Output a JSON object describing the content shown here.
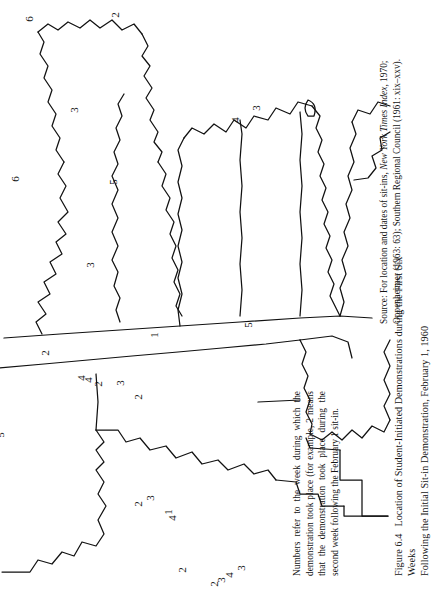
{
  "figure": {
    "number": "Figure 6.4",
    "title_line1": "Location of Student-Initiated Demonstrations during the First Six Weeks",
    "title_line2": "Following the Initial Sit-in Demonstration, February 1, 1960"
  },
  "note": {
    "text": "Numbers refer to the week during which the demonstration took place (for example, 2 means that the demonstration took place during the second week following the February 1 sit-in."
  },
  "source": {
    "prefix": "Source: For location and dates of sit-ins, ",
    "italic": "New York Times Index",
    "suffix": ", 1970; Oppenheimer (1963: 63); Southern Regional Council (1961: xix–xxv)."
  },
  "map": {
    "type": "choropleth-point-map",
    "region": "Southern and border United States",
    "legend_meaning": "Each printed digit marks a city where a student sit-in demonstration occurred; the digit is the week number (1-6) after February 1, 1960.",
    "line_color": "#111111",
    "fill_color": "#ffffff",
    "week_labels": [
      {
        "value": "3",
        "x": 163,
        "y": 22,
        "area": "Oklahoma/Kansas border"
      },
      {
        "value": "4",
        "x": 176,
        "y": 15,
        "area": "Oklahoma"
      },
      {
        "value": "3",
        "x": 185,
        "y": 10,
        "area": "Oklahoma"
      },
      {
        "value": "2",
        "x": 193,
        "y": 6,
        "area": "Oklahoma"
      },
      {
        "value": "2",
        "x": 228,
        "y": 20,
        "area": "Missouri"
      },
      {
        "value": "1",
        "x": 244,
        "y": 78,
        "area": "Tennessee"
      },
      {
        "value": "4",
        "x": 239,
        "y": 72,
        "area": "Tennessee"
      },
      {
        "value": "3",
        "x": 264,
        "y": 92,
        "area": "Tennessee"
      },
      {
        "value": "2",
        "x": 277,
        "y": 86,
        "area": "Tennessee"
      },
      {
        "value": "1",
        "x": 259,
        "y": 255,
        "area": "Tennessee west"
      },
      {
        "value": "2",
        "x": 277,
        "y": 193,
        "area": "Kentucky"
      },
      {
        "value": "3",
        "x": 297,
        "y": 207,
        "area": "Kentucky"
      },
      {
        "value": "2",
        "x": 321,
        "y": 206,
        "area": "Kentucky"
      },
      {
        "value": "4",
        "x": 332,
        "y": 210,
        "area": "Kentucky"
      },
      {
        "value": "4",
        "x": 340,
        "y": 212,
        "area": "Kentucky"
      },
      {
        "value": "5",
        "x": 155,
        "y": 265,
        "area": "Arkansas/Texas"
      },
      {
        "value": "5",
        "x": 430,
        "y": 155,
        "area": "Virginia"
      },
      {
        "value": "5",
        "x": 472,
        "y": 181,
        "area": "Virginia"
      },
      {
        "value": "5",
        "x": 486,
        "y": 188,
        "area": "Virginia"
      },
      {
        "value": "4",
        "x": 500,
        "y": 205,
        "area": "Virginia"
      },
      {
        "value": "4",
        "x": 510,
        "y": 212,
        "area": "Virginia"
      },
      {
        "value": "4",
        "x": 520,
        "y": 216,
        "area": "Virginia"
      },
      {
        "value": "2",
        "x": 380,
        "y": 237,
        "area": "North Carolina"
      },
      {
        "value": "6",
        "x": 742,
        "y": 238,
        "area": "Maryland"
      },
      {
        "value": "3",
        "x": 330,
        "y": 325,
        "area": "Arkansas"
      },
      {
        "value": "5",
        "x": 305,
        "y": 408,
        "area": "Arkansas"
      },
      {
        "value": "5",
        "x": 450,
        "y": 405,
        "area": "Mississippi/Alabama"
      },
      {
        "value": "3",
        "x": 348,
        "y": 480,
        "area": "Louisiana"
      },
      {
        "value": "2",
        "x": 302,
        "y": 575,
        "area": "Louisiana"
      },
      {
        "value": "6",
        "x": 397,
        "y": 571,
        "area": "Mississippi"
      },
      {
        "value": "3",
        "x": 146,
        "y": 482,
        "area": "Texas"
      },
      {
        "value": "4",
        "x": 170,
        "y": 470,
        "area": "Texas"
      },
      {
        "value": "44",
        "x": 570,
        "y": 520,
        "area": "Georgia"
      },
      {
        "value": "6",
        "x": 413,
        "y": 411,
        "area": "Florida panhandle"
      },
      {
        "value": "5",
        "x": 520,
        "y": 600,
        "area": "Florida"
      },
      {
        "value": "6",
        "x": 545,
        "y": 615,
        "area": "Florida"
      },
      {
        "value": "6",
        "x": 615,
        "y": 680,
        "area": "Florida"
      },
      {
        "value": "6",
        "x": 635,
        "y": 695,
        "area": "Florida"
      }
    ]
  }
}
